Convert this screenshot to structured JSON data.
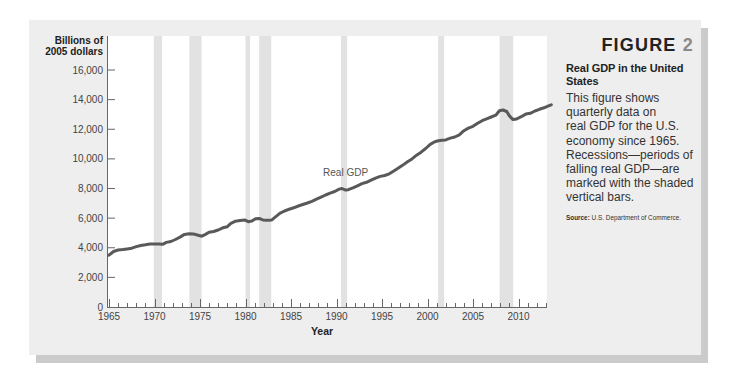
{
  "figure": {
    "label": "FIGURE",
    "number": "2",
    "title_lines": [
      "Real GDP in the United",
      "States"
    ],
    "description_lines": [
      "This figure shows",
      "quarterly data on",
      "real GDP for the U.S.",
      "economy since 1965.",
      "Recessions—periods of",
      "falling real GDP—are",
      "marked with the shaded",
      "vertical bars."
    ],
    "source_label": "Source:",
    "source_text": "U.S. Department of Commerce."
  },
  "colors": {
    "panel_bg": "#eeeeee",
    "panel_shadow": "#cbcbcb",
    "plot_bg": "#ffffff",
    "recession_bar": "#e2e2e2",
    "line": "#595959",
    "axis": "#666666",
    "tick_label": "#444444",
    "annotation": "#555555",
    "figure_number": "#8a8a8a"
  },
  "chart_data": {
    "type": "line",
    "title": "Real GDP in the United States",
    "xlabel": "Year",
    "ylabel": "Billions of 2005 dollars",
    "ylabel_lines": [
      "Billions of",
      "2005 dollars"
    ],
    "xlim": [
      1965,
      2013.1
    ],
    "ylim": [
      0,
      16000
    ],
    "grid": false,
    "legend": null,
    "x_ticks": [
      1965,
      1970,
      1975,
      1980,
      1985,
      1990,
      1995,
      2000,
      2005,
      2010
    ],
    "x_tick_labels": [
      "1965",
      "1970",
      "1975",
      "1980",
      "1985",
      "1990",
      "1995",
      "2000",
      "2005",
      "2010"
    ],
    "x_minor_tick_step": 1,
    "y_ticks": [
      0,
      2000,
      4000,
      6000,
      8000,
      10000,
      12000,
      14000,
      16000
    ],
    "y_tick_labels": [
      "0",
      "2,000",
      "4,000",
      "6,000",
      "8,000",
      "10,000",
      "12,000",
      "14,000",
      "16,000"
    ],
    "annotations": [
      {
        "text": "Real GDP",
        "x": 1991.0,
        "y": 9050
      }
    ],
    "shaded_regions": [
      {
        "label": "Recession",
        "start": 1969.92,
        "end": 1970.83
      },
      {
        "label": "Recession",
        "start": 1973.83,
        "end": 1975.17
      },
      {
        "label": "Recession",
        "start": 1980.0,
        "end": 1980.5
      },
      {
        "label": "Recession",
        "start": 1981.5,
        "end": 1982.83
      },
      {
        "label": "Recession",
        "start": 1990.5,
        "end": 1991.17
      },
      {
        "label": "Recession",
        "start": 2001.17,
        "end": 2001.83
      },
      {
        "label": "Recession",
        "start": 2007.92,
        "end": 2009.42
      }
    ],
    "series": [
      {
        "name": "Real GDP",
        "x": [
          1965.0,
          1965.5,
          1966.0,
          1966.5,
          1967.0,
          1967.5,
          1968.0,
          1968.5,
          1969.0,
          1969.5,
          1970.0,
          1970.5,
          1970.9,
          1971.3,
          1971.8,
          1972.3,
          1972.8,
          1973.3,
          1973.8,
          1974.3,
          1974.8,
          1975.2,
          1975.6,
          1976.0,
          1976.5,
          1977.0,
          1977.5,
          1978.0,
          1978.4,
          1978.9,
          1979.4,
          1979.9,
          1980.3,
          1980.7,
          1981.1,
          1981.5,
          1981.9,
          1982.4,
          1982.9,
          1983.3,
          1983.8,
          1984.3,
          1984.8,
          1985.3,
          1985.8,
          1986.3,
          1986.8,
          1987.3,
          1987.8,
          1988.3,
          1988.8,
          1989.3,
          1989.8,
          1990.3,
          1990.6,
          1991.0,
          1991.3,
          1991.8,
          1992.3,
          1992.8,
          1993.3,
          1993.8,
          1994.3,
          1994.8,
          1995.3,
          1995.8,
          1996.3,
          1996.8,
          1997.3,
          1997.8,
          1998.3,
          1998.8,
          1999.3,
          1999.8,
          2000.3,
          2000.8,
          2001.2,
          2001.6,
          2002.0,
          2002.5,
          2003.0,
          2003.5,
          2004.0,
          2004.5,
          2005.0,
          2005.5,
          2006.0,
          2006.5,
          2007.0,
          2007.5,
          2007.9,
          2008.3,
          2008.7,
          2009.0,
          2009.4,
          2009.8,
          2010.3,
          2010.8,
          2011.3,
          2011.8,
          2012.3,
          2012.8,
          2013.3,
          2013.6
        ],
        "values": [
          3500,
          3750,
          3850,
          3880,
          3920,
          3970,
          4080,
          4150,
          4200,
          4250,
          4250,
          4260,
          4230,
          4360,
          4420,
          4560,
          4720,
          4900,
          4950,
          4930,
          4850,
          4780,
          4900,
          5050,
          5100,
          5200,
          5350,
          5420,
          5650,
          5790,
          5830,
          5880,
          5760,
          5800,
          5960,
          5980,
          5880,
          5850,
          5880,
          6080,
          6330,
          6480,
          6600,
          6700,
          6820,
          6920,
          7020,
          7130,
          7280,
          7420,
          7560,
          7690,
          7800,
          7960,
          8000,
          7890,
          7920,
          8040,
          8180,
          8330,
          8420,
          8560,
          8700,
          8820,
          8880,
          8990,
          9180,
          9380,
          9580,
          9800,
          10000,
          10250,
          10450,
          10700,
          10980,
          11150,
          11230,
          11260,
          11280,
          11400,
          11480,
          11620,
          11900,
          12080,
          12200,
          12400,
          12580,
          12700,
          12830,
          12950,
          13250,
          13300,
          13200,
          12900,
          12650,
          12690,
          12850,
          13020,
          13080,
          13230,
          13350,
          13450,
          13580,
          13650
        ]
      }
    ]
  }
}
